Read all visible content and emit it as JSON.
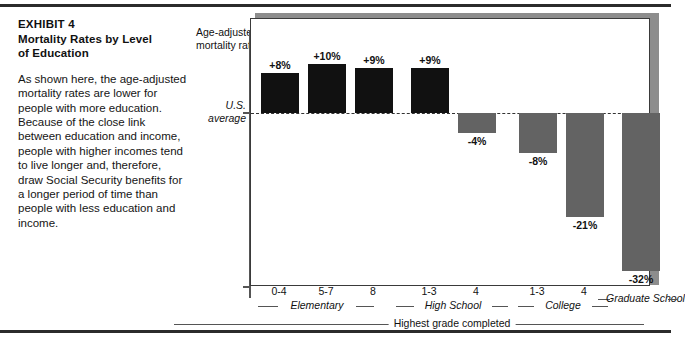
{
  "exhibit": {
    "kicker": "EXHIBIT 4",
    "title_line1": "Mortality Rates by Level",
    "title_line2": "of Education",
    "body": "As shown here, the age-adjusted mortality rates are lower for people with more education. Because of the close link between education and income, people with higher incomes tend to live longer and, therefore, draw Social Security benefits for a longer period of time than people with less education and income."
  },
  "chart_labels": {
    "y_axis_title_line1": "Age-adjusted",
    "y_axis_title_line2": "mortality rate",
    "baseline_line1": "U.S.",
    "baseline_line2": "average",
    "x_axis_title": "Highest grade completed"
  },
  "chart_data": {
    "type": "bar",
    "title": "Mortality Rates by Level of Education",
    "xlabel": "Highest grade completed",
    "ylabel": "Age-adjusted mortality rate",
    "baseline_label": "U.S. average",
    "baseline_value": 0,
    "ylim": [
      -36,
      14
    ],
    "grid": false,
    "legend": "none",
    "categories": [
      "0-4",
      "5-7",
      "8",
      "1-3",
      "4",
      "1-3",
      "4",
      ""
    ],
    "values": [
      8,
      10,
      9,
      9,
      -4,
      -8,
      -21,
      -32
    ],
    "value_labels": [
      "+8%",
      "+10%",
      "+9%",
      "+9%",
      "-4%",
      "-8%",
      "-21%",
      "-32%"
    ],
    "groups": [
      {
        "label": "Elementary",
        "members": [
          "0-4",
          "5-7",
          "8"
        ]
      },
      {
        "label": "High School",
        "members": [
          "1-3",
          "4"
        ]
      },
      {
        "label": "College",
        "members": [
          "1-3",
          "4"
        ]
      },
      {
        "label": "Graduate School",
        "members": [
          ""
        ]
      }
    ],
    "colors": {
      "positive": "#111111",
      "negative": "#636363"
    }
  }
}
